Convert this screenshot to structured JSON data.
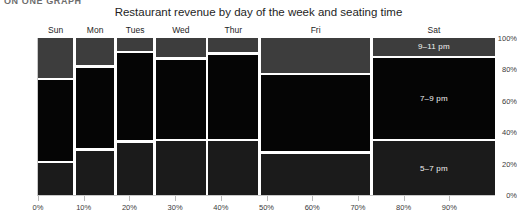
{
  "page": {
    "cropped_header_text": "ON ONE GRAPH"
  },
  "chart_data": {
    "type": "mosaic",
    "title": "Restaurant revenue by day of the week and seating time",
    "xlabel": "",
    "ylabel": "",
    "xlim": [
      0,
      100
    ],
    "ylim": [
      0,
      100
    ],
    "grid": false,
    "legend_position": "in-plot-right",
    "x_axis": {
      "ticks": [
        0,
        10,
        20,
        30,
        40,
        50,
        60,
        70,
        80,
        90
      ],
      "tick_labels": [
        "0%",
        "10%",
        "20%",
        "30%",
        "40%",
        "50%",
        "60%",
        "70%",
        "80%",
        "90%"
      ],
      "unit": "%"
    },
    "y_axis": {
      "ticks": [
        0,
        20,
        40,
        60,
        80,
        100
      ],
      "tick_labels": [
        "0%",
        "20%",
        "40%",
        "60%",
        "80%",
        "100%"
      ],
      "unit": "%"
    },
    "categories": [
      "Sun",
      "Mon",
      "Tues",
      "Wed",
      "Thur",
      "Fri",
      "Sat"
    ],
    "column_widths_pct": [
      8.0,
      9.0,
      8.5,
      11.5,
      11.5,
      24.5,
      27.0
    ],
    "column_starts_pct": [
      0.0,
      8.0,
      17.0,
      25.5,
      37.0,
      48.5,
      73.0
    ],
    "series": [
      {
        "name": "9-11 pm",
        "label": "9–11 pm",
        "color": "#3d3d3d",
        "values": [
          26,
          18,
          9,
          13,
          10,
          23,
          12
        ]
      },
      {
        "name": "7-9 pm",
        "label": "7–9 pm",
        "color": "#050505",
        "values": [
          53,
          53,
          57,
          52,
          55,
          50,
          53
        ]
      },
      {
        "name": "5-7 pm",
        "label": "5–7 pm",
        "color": "#1b1b1b",
        "values": [
          21,
          29,
          34,
          35,
          35,
          27,
          35
        ]
      }
    ],
    "labeled_column": "Sat",
    "colors": {
      "band_top": "#3d3d3d",
      "band_middle": "#050505",
      "band_bottom": "#1b1b1b",
      "gap": "#ffffff",
      "axis": "#c9c9c9",
      "text": "#1e1e1e"
    }
  }
}
